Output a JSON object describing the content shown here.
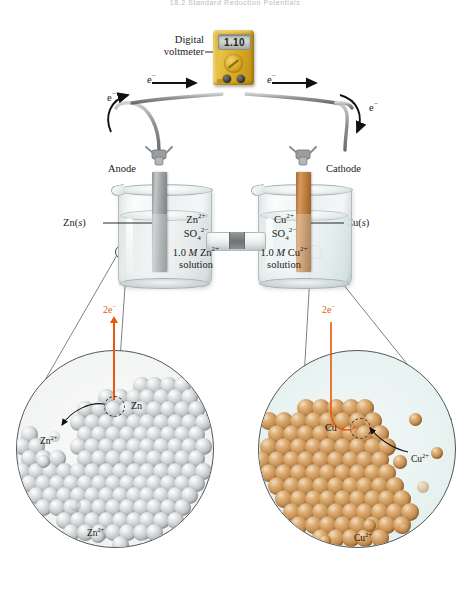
{
  "page": {
    "header": "18.2   Standard Reduction Potentials",
    "figure_type": "galvanic-cell-diagram",
    "width": 470,
    "height": 589
  },
  "colors": {
    "electron_orange": "#e8590c",
    "copper": "#c0874a",
    "zinc": "#bcc0c2",
    "voltmeter_body": "#d9a922",
    "cu_solution": "#e6f1ef",
    "zn_solution": "#eceff0"
  },
  "voltmeter": {
    "label_line1": "Digital",
    "label_line2": "voltmeter",
    "reading": "1.10",
    "display_units": ""
  },
  "electron_flow": {
    "labels": [
      "e−",
      "e−",
      "e−",
      "e−"
    ],
    "symbol": "e",
    "superscript": "−",
    "direction": "anode-to-cathode"
  },
  "electrodes": {
    "anode": {
      "name": "Anode",
      "material_label": "Zn(s)",
      "material_symbol": "Zn",
      "state": "s"
    },
    "cathode": {
      "name": "Cathode",
      "material_label": "Cu(s)",
      "material_symbol": "Cu",
      "state": "s"
    }
  },
  "beakers": {
    "left": {
      "ion_cation": "Zn",
      "ion_cation_charge": "2+",
      "ion_anion": "SO",
      "ion_anion_sub": "4",
      "ion_anion_charge": "2−",
      "concentration": "1.0",
      "molarity_symbol": "M",
      "solute": "Zn",
      "solute_charge": "2+",
      "solution_word": "solution"
    },
    "right": {
      "ion_cation": "Cu",
      "ion_cation_charge": "2+",
      "ion_anion": "SO",
      "ion_anion_sub": "4",
      "ion_anion_charge": "2−",
      "concentration": "1.0",
      "molarity_symbol": "M",
      "solute": "Cu",
      "solute_charge": "2+",
      "solution_word": "solution"
    }
  },
  "insets": {
    "left": {
      "electron_label_count": "2",
      "electron_label_symbol": "e",
      "electron_label_charge": "−",
      "metal_label": "Zn",
      "ion_label_1": "Zn",
      "ion_label_1_charge": "2+",
      "ion_label_2": "Zn",
      "ion_label_2_charge": "2+",
      "process": "oxidation"
    },
    "right": {
      "electron_label_count": "2",
      "electron_label_symbol": "e",
      "electron_label_charge": "−",
      "metal_label": "Cu",
      "ion_label_1": "Cu",
      "ion_label_1_charge": "2+",
      "ion_label_2": "Cu",
      "ion_label_2_charge": "2+",
      "process": "reduction"
    }
  },
  "salt_bridge": {
    "present": true,
    "label": ""
  }
}
